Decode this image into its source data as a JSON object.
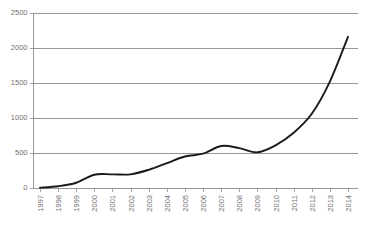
{
  "chart_data": {
    "type": "line",
    "title": "",
    "subtitle": "",
    "xlabel": "",
    "ylabel": "",
    "grid": "horizontal",
    "legend": "none",
    "xlim": [
      1997,
      2014
    ],
    "ylim": [
      0,
      2500
    ],
    "y_ticks": [
      0,
      500,
      1000,
      1500,
      2000,
      2500
    ],
    "y_tick_labels": [
      "0",
      "500",
      "1000",
      "1500",
      "2000",
      "2500"
    ],
    "categories": [
      "1997",
      "1998",
      "1999",
      "2000",
      "2001",
      "2002",
      "2003",
      "2004",
      "2005",
      "2006",
      "2007",
      "2008",
      "2009",
      "2010",
      "2011",
      "2012",
      "2013",
      "2014"
    ],
    "series": [
      {
        "name": "",
        "color": "#1a1a1a",
        "values": [
          5,
          25,
          75,
          190,
          195,
          195,
          260,
          355,
          450,
          490,
          600,
          570,
          510,
          610,
          790,
          1060,
          1520,
          2160
        ]
      }
    ],
    "annotations": []
  },
  "axes": {
    "y_axis_name": "y-axis",
    "x_axis_name": "x-axis"
  },
  "colors": {
    "line": "#1a1a1a",
    "grid": "#8c8c8c",
    "axis": "#8c8c8c",
    "tick_text": "#6f6f6f",
    "background": "#ffffff"
  }
}
